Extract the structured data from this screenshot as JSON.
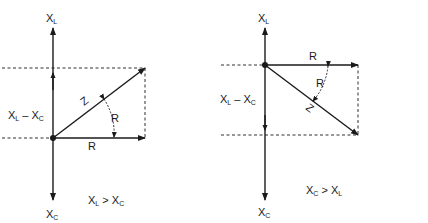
{
  "diagrams": [
    {
      "id": "inductive",
      "axis_top_label": "X",
      "axis_top_sub": "L",
      "axis_bottom_label": "X",
      "axis_bottom_sub": "C",
      "reactance_label_a": "X",
      "reactance_label_a_sub": "L",
      "reactance_label_op": " – ",
      "reactance_label_b": "X",
      "reactance_label_b_sub": "C",
      "resistance_label": "R",
      "angle_label": "R",
      "impedance_label": "Z",
      "condition_a": "X",
      "condition_a_sub": "L",
      "condition_op": " > ",
      "condition_b": "X",
      "condition_b_sub": "C"
    },
    {
      "id": "capacitive",
      "axis_top_label": "X",
      "axis_top_sub": "L",
      "axis_bottom_label": "X",
      "axis_bottom_sub": "C",
      "reactance_label_a": "X",
      "reactance_label_a_sub": "L",
      "reactance_label_op": " – ",
      "reactance_label_b": "X",
      "reactance_label_b_sub": "C",
      "resistance_label": "R",
      "angle_label": "R",
      "impedance_label": "Z",
      "condition_a": "X",
      "condition_a_sub": "C",
      "condition_op": " > ",
      "condition_b": "X",
      "condition_b_sub": "L"
    }
  ],
  "colors": {
    "stroke": "#1a1a1a",
    "background": "#ffffff"
  }
}
